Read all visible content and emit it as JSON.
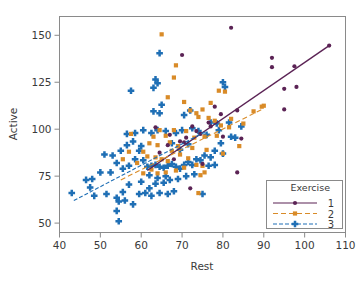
{
  "chart_data": {
    "type": "scatter",
    "title": "",
    "xlabel": "Rest",
    "ylabel": "Active",
    "xlim": [
      40,
      110
    ],
    "ylim": [
      45,
      160
    ],
    "xticks": [
      40,
      50,
      60,
      70,
      80,
      90,
      100,
      110
    ],
    "yticks": [
      50,
      75,
      100,
      125,
      150
    ],
    "grid": false,
    "legend": {
      "title": "Exercise",
      "position": "lower-right",
      "entries": [
        {
          "label": "1",
          "color": "#5B2355",
          "marker": "circle",
          "linestyle": "solid"
        },
        {
          "label": "2",
          "color": "#D98B28",
          "marker": "square",
          "linestyle": "dashed"
        },
        {
          "label": "3",
          "color": "#1F6FB5",
          "marker": "diamond",
          "linestyle": "dashdot"
        }
      ]
    },
    "colors": {
      "series1": "#5B2355",
      "series2": "#D98B28",
      "series3": "#1F6FB5",
      "axis": "#808080",
      "text": "#3a3a3a"
    },
    "fit_lines": [
      {
        "name": "1",
        "color": "#5B2355",
        "linestyle": "solid",
        "x": [
          61.5,
          106.0
        ],
        "y": [
          78.0,
          144.5
        ]
      },
      {
        "name": "2",
        "color": "#D98B28",
        "linestyle": "dashed",
        "x": [
          55.0,
          90.0
        ],
        "y": [
          73.0,
          111.0
        ]
      },
      {
        "name": "3",
        "color": "#1F6FB5",
        "linestyle": "dashdot",
        "x": [
          43.5,
          76.0
        ],
        "y": [
          62.0,
          99.0
        ]
      }
    ],
    "series": [
      {
        "name": "1",
        "marker": "circle",
        "color": "#5B2355",
        "points": [
          [
            82.0,
            154.0
          ],
          [
            92.0,
            138.0
          ],
          [
            92.0,
            133.0
          ],
          [
            97.5,
            133.5
          ],
          [
            95.0,
            121.5
          ],
          [
            98.0,
            122.5
          ],
          [
            95.0,
            110.5
          ],
          [
            83.5,
            110.0
          ],
          [
            106.0,
            144.5
          ],
          [
            70.0,
            139.5
          ],
          [
            78.0,
            112.0
          ],
          [
            79.5,
            108.0
          ],
          [
            76.5,
            103.5
          ],
          [
            72.5,
            101.5
          ],
          [
            84.5,
            95.0
          ],
          [
            74.5,
            97.5
          ],
          [
            71.0,
            95.5
          ],
          [
            70.5,
            93.0
          ],
          [
            69.5,
            93.5
          ],
          [
            66.5,
            91.5
          ],
          [
            83.5,
            77.0
          ],
          [
            72.0,
            68.5
          ],
          [
            75.0,
            81.5
          ],
          [
            68.0,
            84.0
          ],
          [
            63.5,
            101.0
          ],
          [
            80.0,
            96.0
          ],
          [
            77.0,
            101.5
          ],
          [
            73.5,
            99.0
          ],
          [
            67.0,
            97.0
          ],
          [
            64.5,
            87.5
          ]
        ]
      },
      {
        "name": "2",
        "marker": "square",
        "color": "#D98B28",
        "points": [
          [
            65.0,
            150.5
          ],
          [
            68.5,
            134.0
          ],
          [
            68.0,
            127.5
          ],
          [
            66.5,
            117.0
          ],
          [
            70.5,
            114.5
          ],
          [
            79.0,
            120.5
          ],
          [
            80.5,
            120.0
          ],
          [
            77.0,
            114.0
          ],
          [
            75.0,
            110.5
          ],
          [
            73.5,
            108.5
          ],
          [
            72.0,
            110.0
          ],
          [
            74.0,
            106.5
          ],
          [
            76.5,
            106.0
          ],
          [
            78.0,
            104.5
          ],
          [
            82.0,
            105.5
          ],
          [
            85.0,
            103.0
          ],
          [
            87.5,
            109.5
          ],
          [
            89.5,
            112.0
          ],
          [
            90.0,
            112.5
          ],
          [
            84.0,
            91.0
          ],
          [
            80.0,
            87.0
          ],
          [
            78.5,
            96.5
          ],
          [
            75.5,
            96.0
          ],
          [
            73.0,
            95.5
          ],
          [
            71.0,
            99.0
          ],
          [
            68.0,
            99.5
          ],
          [
            66.0,
            96.5
          ],
          [
            64.5,
            99.5
          ],
          [
            63.0,
            96.0
          ],
          [
            62.0,
            92.5
          ],
          [
            60.5,
            88.0
          ],
          [
            61.5,
            85.5
          ],
          [
            63.5,
            85.0
          ],
          [
            65.0,
            84.0
          ],
          [
            66.5,
            83.0
          ],
          [
            67.5,
            88.5
          ],
          [
            69.5,
            86.5
          ],
          [
            71.5,
            84.5
          ],
          [
            73.5,
            81.0
          ],
          [
            75.0,
            80.5
          ],
          [
            70.5,
            79.5
          ],
          [
            68.5,
            78.0
          ],
          [
            66.0,
            77.0
          ],
          [
            64.0,
            76.5
          ],
          [
            62.5,
            78.5
          ],
          [
            60.5,
            76.5
          ],
          [
            59.0,
            82.0
          ],
          [
            57.5,
            97.5
          ],
          [
            57.0,
            88.0
          ],
          [
            55.5,
            84.0
          ],
          [
            74.5,
            75.5
          ],
          [
            75.5,
            77.0
          ],
          [
            74.0,
            66.0
          ],
          [
            79.5,
            102.0
          ],
          [
            81.5,
            101.0
          ],
          [
            69.0,
            91.0
          ],
          [
            67.0,
            93.0
          ],
          [
            64.0,
            91.5
          ],
          [
            72.5,
            90.0
          ],
          [
            76.0,
            89.0
          ]
        ]
      },
      {
        "name": "3",
        "marker": "diamond",
        "color": "#1F6FB5",
        "points": [
          [
            64.5,
            140.5
          ],
          [
            63.5,
            126.5
          ],
          [
            64.0,
            124.5
          ],
          [
            63.0,
            122.0
          ],
          [
            57.5,
            120.5
          ],
          [
            80.0,
            125.0
          ],
          [
            80.5,
            122.5
          ],
          [
            65.0,
            113.0
          ],
          [
            63.0,
            109.5
          ],
          [
            64.5,
            108.5
          ],
          [
            72.0,
            110.0
          ],
          [
            70.5,
            107.5
          ],
          [
            77.0,
            103.5
          ],
          [
            78.5,
            103.0
          ],
          [
            81.5,
            103.5
          ],
          [
            84.5,
            101.5
          ],
          [
            79.0,
            99.5
          ],
          [
            76.0,
            97.0
          ],
          [
            74.0,
            99.0
          ],
          [
            72.5,
            100.5
          ],
          [
            70.0,
            99.5
          ],
          [
            68.5,
            98.0
          ],
          [
            66.0,
            99.0
          ],
          [
            64.0,
            99.5
          ],
          [
            62.5,
            98.0
          ],
          [
            60.5,
            99.5
          ],
          [
            58.5,
            98.0
          ],
          [
            56.5,
            97.5
          ],
          [
            55.0,
            88.5
          ],
          [
            53.0,
            86.0
          ],
          [
            51.0,
            86.5
          ],
          [
            54.0,
            82.0
          ],
          [
            52.5,
            77.0
          ],
          [
            50.0,
            77.0
          ],
          [
            48.0,
            73.5
          ],
          [
            46.5,
            73.0
          ],
          [
            43.0,
            66.0
          ],
          [
            47.5,
            69.0
          ],
          [
            48.5,
            64.5
          ],
          [
            51.5,
            65.5
          ],
          [
            54.0,
            63.5
          ],
          [
            55.5,
            66.5
          ],
          [
            57.0,
            70.5
          ],
          [
            56.0,
            62.0
          ],
          [
            54.5,
            61.5
          ],
          [
            54.0,
            56.5
          ],
          [
            54.5,
            51.0
          ],
          [
            58.0,
            60.0
          ],
          [
            59.5,
            65.5
          ],
          [
            61.0,
            66.0
          ],
          [
            62.0,
            68.5
          ],
          [
            63.5,
            71.0
          ],
          [
            60.0,
            72.0
          ],
          [
            62.5,
            64.5
          ],
          [
            64.5,
            66.0
          ],
          [
            66.5,
            65.5
          ],
          [
            68.0,
            67.0
          ],
          [
            65.5,
            71.5
          ],
          [
            67.0,
            73.0
          ],
          [
            69.0,
            73.5
          ],
          [
            61.5,
            80.0
          ],
          [
            62.5,
            80.5
          ],
          [
            63.5,
            81.0
          ],
          [
            64.5,
            80.0
          ],
          [
            65.5,
            79.5
          ],
          [
            66.5,
            80.5
          ],
          [
            67.5,
            81.5
          ],
          [
            68.5,
            80.0
          ],
          [
            69.5,
            79.0
          ],
          [
            70.5,
            81.0
          ],
          [
            71.5,
            82.5
          ],
          [
            72.5,
            81.0
          ],
          [
            73.5,
            84.0
          ],
          [
            74.5,
            83.5
          ],
          [
            75.5,
            86.0
          ],
          [
            77.0,
            85.0
          ],
          [
            78.0,
            88.5
          ],
          [
            79.5,
            92.5
          ],
          [
            82.0,
            96.0
          ],
          [
            83.0,
            95.5
          ],
          [
            66.0,
            75.0
          ],
          [
            64.0,
            74.0
          ],
          [
            62.0,
            75.5
          ],
          [
            60.5,
            83.5
          ],
          [
            58.5,
            84.0
          ],
          [
            59.5,
            88.5
          ],
          [
            57.0,
            80.5
          ],
          [
            55.5,
            79.0
          ],
          [
            71.0,
            75.0
          ],
          [
            73.0,
            76.0
          ],
          [
            75.0,
            65.5
          ],
          [
            69.5,
            89.0
          ],
          [
            71.5,
            92.0
          ],
          [
            67.5,
            92.5
          ],
          [
            60.0,
            91.0
          ],
          [
            58.0,
            93.5
          ],
          [
            56.5,
            91.5
          ],
          [
            76.5,
            80.5
          ],
          [
            78.0,
            81.0
          ],
          [
            80.0,
            87.0
          ]
        ]
      }
    ]
  }
}
